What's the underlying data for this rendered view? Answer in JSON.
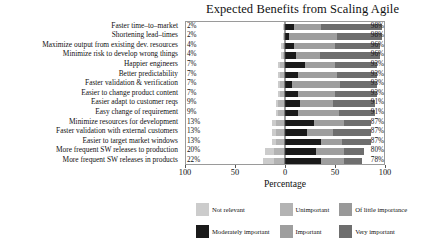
{
  "chart_data": {
    "type": "bar",
    "subtype": "diverging-stacked-likert",
    "title": "Expected Benefits from Scaling Agile",
    "xlabel": "Percentage",
    "ylabel": "",
    "xlim": [
      -100,
      100
    ],
    "xticks": [
      -100,
      -50,
      0,
      50,
      100
    ],
    "xtick_labels": [
      "100",
      "50",
      "0",
      "50",
      "100"
    ],
    "grid": false,
    "legend_position": "bottom",
    "legend": [
      {
        "name": "Not relevant",
        "color": "#cccccc"
      },
      {
        "name": "Unimportant",
        "color": "#b3b3b3"
      },
      {
        "name": "Of little importance",
        "color": "#999999"
      },
      {
        "name": "Moderately important",
        "color": "#1a1a1a"
      },
      {
        "name": "Important",
        "color": "#9e9e9e"
      },
      {
        "name": "Very important",
        "color": "#6e6e6e"
      }
    ],
    "categories": [
      "Faster time–to–market",
      "Shortening lead–times",
      "Maximize output from existing dev. resources",
      "Minimize risk to develop wrong things",
      "Happier engineers",
      "Better predictability",
      "Faster validation & verification",
      "Easier to change product content",
      "Easier adapt to customer reqs",
      "Easy change of requirement",
      "Minimize resources for development",
      "Faster validation with external customers",
      "Easier to target market windows",
      "More frequent SW releases to production",
      "More frequent SW releases in products"
    ],
    "negative_labels": [
      "2%",
      "2%",
      "4%",
      "4%",
      "7%",
      "7%",
      "7%",
      "7%",
      "9%",
      "9%",
      "13%",
      "13%",
      "13%",
      "20%",
      "22%"
    ],
    "positive_labels": [
      "98%",
      "98%",
      "96%",
      "96%",
      "93%",
      "93%",
      "93%",
      "93%",
      "91%",
      "91%",
      "87%",
      "87%",
      "87%",
      "80%",
      "78%"
    ],
    "series": [
      {
        "name": "Not relevant",
        "side": "negative",
        "values": [
          1,
          1,
          2,
          2,
          2,
          2,
          2,
          2,
          2,
          2,
          4,
          4,
          4,
          9,
          11
        ]
      },
      {
        "name": "Unimportant",
        "side": "negative",
        "values": [
          1,
          1,
          2,
          2,
          5,
          5,
          5,
          5,
          7,
          7,
          9,
          9,
          9,
          11,
          11
        ]
      },
      {
        "name": "Of little importance",
        "side": "negative",
        "values": [
          0,
          0,
          0,
          0,
          0,
          0,
          0,
          0,
          0,
          0,
          0,
          0,
          0,
          0,
          0
        ]
      },
      {
        "name": "Moderately important",
        "side": "positive",
        "values": [
          9,
          4,
          9,
          11,
          20,
          13,
          7,
          13,
          15,
          13,
          29,
          22,
          36,
          31,
          36
        ]
      },
      {
        "name": "Important",
        "side": "positive",
        "values": [
          27,
          49,
          42,
          24,
          31,
          40,
          49,
          38,
          33,
          42,
          31,
          27,
          22,
          29,
          24
        ]
      },
      {
        "name": "Very important",
        "side": "positive",
        "values": [
          62,
          45,
          45,
          61,
          42,
          40,
          37,
          42,
          43,
          36,
          27,
          38,
          29,
          20,
          18
        ]
      }
    ]
  }
}
